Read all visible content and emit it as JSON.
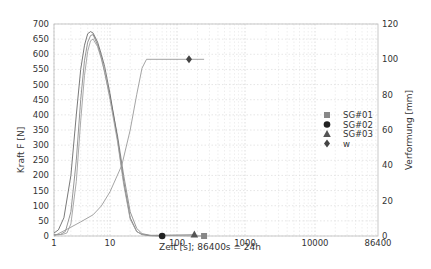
{
  "chart_data": {
    "type": "line",
    "title": "",
    "xlabel": "Zeit [s]; 86400s = 24h",
    "ylabel": "Kraft F [N]",
    "y2label": "Verformung [mm]",
    "xscale": "log",
    "xlim": [
      1,
      86400
    ],
    "ylim": [
      0,
      700
    ],
    "y2lim": [
      0,
      120
    ],
    "x_ticks": [
      "1",
      "10",
      "100",
      "1000",
      "10000",
      "86400"
    ],
    "y_ticks": [
      "0",
      "50",
      "100",
      "150",
      "200",
      "250",
      "300",
      "350",
      "400",
      "450",
      "500",
      "550",
      "600",
      "650",
      "700"
    ],
    "y2_ticks": [
      "0",
      "20",
      "40",
      "60",
      "80",
      "100",
      "120"
    ],
    "grid": true,
    "legend_position": "right-center",
    "legend": [
      {
        "label": "SG#01",
        "marker": "square",
        "color": "#888888"
      },
      {
        "label": "SG#02",
        "marker": "circle",
        "color": "#222222"
      },
      {
        "label": "SG#03",
        "marker": "triangle",
        "color": "#555555"
      },
      {
        "label": "w",
        "marker": "diamond",
        "color": "#444444"
      }
    ],
    "series": [
      {
        "name": "SG#01",
        "axis": "left",
        "marker": "square",
        "marker_at": [
          250,
          0
        ],
        "x": [
          1,
          1.3,
          1.6,
          2,
          2.5,
          3,
          3.5,
          4,
          4.5,
          5,
          6,
          7,
          8,
          10,
          13,
          16,
          20,
          25,
          30,
          40,
          250
        ],
        "y": [
          5,
          5,
          15,
          80,
          250,
          450,
          580,
          640,
          662,
          665,
          630,
          590,
          540,
          460,
          330,
          200,
          80,
          25,
          8,
          2,
          0
        ]
      },
      {
        "name": "SG#02",
        "axis": "left",
        "marker": "circle",
        "marker_at": [
          60,
          0
        ],
        "x": [
          1,
          1.2,
          1.5,
          2,
          2.5,
          3,
          3.5,
          4,
          4.5,
          5,
          6,
          7,
          8,
          10,
          13,
          16,
          20,
          25,
          30,
          40,
          60
        ],
        "y": [
          10,
          20,
          60,
          200,
          400,
          550,
          630,
          668,
          675,
          670,
          640,
          600,
          560,
          470,
          320,
          180,
          60,
          15,
          5,
          1,
          0
        ]
      },
      {
        "name": "SG#03",
        "axis": "left",
        "marker": "triangle",
        "marker_at": [
          180,
          5
        ],
        "x": [
          1,
          1.4,
          1.7,
          2,
          2.5,
          3,
          3.5,
          4,
          4.5,
          5,
          6,
          7,
          8,
          10,
          13,
          16,
          20,
          25,
          30,
          40,
          180
        ],
        "y": [
          3,
          5,
          10,
          40,
          180,
          380,
          530,
          610,
          645,
          650,
          625,
          585,
          545,
          450,
          310,
          170,
          55,
          15,
          5,
          2,
          5
        ]
      },
      {
        "name": "w",
        "axis": "right",
        "marker": "diamond",
        "marker_at": [
          150,
          100
        ],
        "x": [
          1,
          2,
          3,
          5,
          7,
          10,
          15,
          20,
          25,
          30,
          35,
          250
        ],
        "y": [
          0,
          5,
          8,
          12,
          17,
          25,
          40,
          60,
          80,
          95,
          100,
          100
        ]
      }
    ]
  }
}
